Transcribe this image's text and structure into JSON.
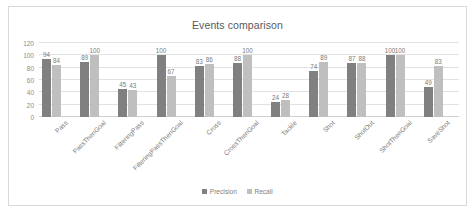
{
  "chart_data": {
    "type": "bar",
    "title": "Events comparison",
    "xlabel": "",
    "ylabel": "",
    "ylim": [
      0,
      120
    ],
    "yticks": [
      120,
      100,
      80,
      60,
      40,
      20,
      0
    ],
    "grid": true,
    "legend_position": "bottom",
    "categories": [
      "Pass",
      "PassThenGoal",
      "FilteringPass",
      "FilteringPassThenGoal",
      "Cross",
      "CrossThenGoal",
      "Tackle",
      "Shot",
      "ShotOut",
      "ShotThenGoal",
      "SaveShot"
    ],
    "series": [
      {
        "name": "Precision",
        "color": "#808080",
        "values": [
          94,
          89,
          45,
          100,
          83,
          88,
          24,
          74,
          87,
          100,
          49
        ]
      },
      {
        "name": "Recall",
        "color": "#bfbfbf",
        "values": [
          84,
          100,
          43,
          67,
          86,
          100,
          28,
          89,
          88,
          100,
          83
        ]
      }
    ]
  },
  "legend": {
    "items": [
      {
        "label": "Precision",
        "color": "#808080"
      },
      {
        "label": "Recall",
        "color": "#bfbfbf"
      }
    ]
  }
}
